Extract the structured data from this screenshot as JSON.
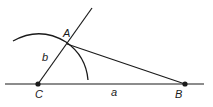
{
  "diagram": {
    "type": "geometric-construction",
    "points": {
      "A": {
        "label": "A",
        "x": 67,
        "y": 44
      },
      "B": {
        "label": "B",
        "x": 185,
        "y": 84
      },
      "C": {
        "label": "C",
        "x": 38,
        "y": 84
      }
    },
    "sides": {
      "a": {
        "label": "a",
        "from": "C",
        "to": "B"
      },
      "b": {
        "label": "b",
        "from": "C",
        "to": "A"
      }
    },
    "colors": {
      "stroke": "#1a1a1a",
      "background": "#ffffff"
    }
  }
}
